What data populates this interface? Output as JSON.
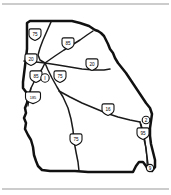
{
  "figure": {
    "name": "georgia-interstate-highway-map",
    "background_color": "#ffffff",
    "outline_color": "#111111",
    "route_color": "#1a1a1a",
    "frame_color": "#9a9a9a"
  },
  "state": {
    "name": "Georgia",
    "outline_path": "M 27,42 L 27,49 L 26,58 L 25,66 L 24,74 L 23,82 L 23,88 L 26,92 L 28,97 L 27,103 L 25,108 L 26,113 L 24,118 L 26,123 L 25,129 L 28,135 L 31,140 L 33,147 L 34,155 L 36,161 L 38,166 L 42,170 L 50,171 L 62,171 L 75,171 L 88,172 L 100,172 L 112,172 L 124,172 L 133,172 L 136,166 L 139,162 L 143,162 L 146,166 L 148,170 L 152,171 L 155,167 L 155,160 L 153,152 L 151,144 L 150,136 L 150,128 L 151,121 L 152,114 L 150,108 L 146,103 L 142,97 L 138,91 L 134,85 L 130,79 L 126,73 L 122,68 L 118,63 L 115,58 L 113,53 L 110,49 L 108,44 L 106,40 L 104,36 L 101,33 L 98,31 L 95,30 L 92,28 L 89,26 L 86,25 L 83,24 L 80,23 L 76,22 L 72,21 L 68,21 L 63,21 L 57,21 L 50,21 L 43,21 L 36,21 L 30,21 L 27,23 Z"
  },
  "routes": [
    {
      "id": "i75-north",
      "label": "75",
      "path": "M 51,22 L 47,31 L 43,40 L 40,48 L 38,55 L 40,60 L 45,63"
    },
    {
      "id": "i85-northeast",
      "label": "85",
      "path": "M 45,63 L 55,56 L 64,50 L 72,45 L 80,40 L 87,35 L 93,31"
    },
    {
      "id": "i20-west",
      "label": "20",
      "path": "M 24,61 L 30,62 L 36,62 L 45,63"
    },
    {
      "id": "i20-east",
      "label": "20",
      "path": "M 45,63 L 58,65 L 70,67 L 82,69 L 94,70 L 104,70 L 110,69"
    },
    {
      "id": "i85-southwest",
      "label": "85",
      "path": "M 45,63 L 42,69 L 38,75 L 34,82 L 31,88 L 29,94 L 28,100"
    },
    {
      "id": "i185-spur",
      "label": "185",
      "path": "M 31,88 L 30,94 L 29,100 L 28,106"
    },
    {
      "id": "i75-south",
      "label": "75",
      "path": "M 45,63 L 48,70 L 52,78 L 57,87 L 63,97 L 68,108 L 71,119 L 73,130 L 74,141 L 76,152 L 78,162 L 79,171"
    },
    {
      "id": "i16-southeast",
      "label": "16",
      "path": "M 59,91 L 70,97 L 82,103 L 94,108 L 106,113 L 118,117 L 130,120 L 140,122"
    },
    {
      "id": "i95-coastal",
      "label": "95",
      "path": "M 140,122 L 142,130 L 144,139 L 146,148 L 147,157 L 148,164 L 148,170"
    },
    {
      "id": "i95-coastal-inner",
      "label": "95",
      "path": "M 141,124 L 143,132 L 145,141 L 146,150 L 147,158 L 147,166"
    }
  ],
  "shields": [
    {
      "id": "shield-i75-north",
      "number": "75",
      "digits": 2,
      "x": 35,
      "y": 36,
      "type": "interstate"
    },
    {
      "id": "shield-i85-north",
      "number": "85",
      "digits": 2,
      "x": 68,
      "y": 45,
      "type": "interstate"
    },
    {
      "id": "shield-i20-west",
      "number": "20",
      "digits": 2,
      "x": 31,
      "y": 61,
      "type": "interstate"
    },
    {
      "id": "shield-i20-east",
      "number": "20",
      "digits": 2,
      "x": 92,
      "y": 66,
      "type": "interstate"
    },
    {
      "id": "shield-i85-south",
      "number": "85",
      "digits": 2,
      "x": 36,
      "y": 78,
      "type": "interstate"
    },
    {
      "id": "shield-i75-hub",
      "number": "75",
      "digits": 2,
      "x": 60,
      "y": 78,
      "type": "interstate"
    },
    {
      "id": "shield-i185",
      "number": "185",
      "digits": 3,
      "x": 33,
      "y": 99,
      "type": "interstate"
    },
    {
      "id": "shield-i16",
      "number": "16",
      "digits": 2,
      "x": 108,
      "y": 111,
      "type": "interstate"
    },
    {
      "id": "shield-i95",
      "number": "95",
      "digits": 2,
      "x": 143,
      "y": 135,
      "type": "interstate"
    },
    {
      "id": "shield-i75-lower",
      "number": "75",
      "digits": 2,
      "x": 76,
      "y": 141,
      "type": "interstate"
    }
  ],
  "markers": [
    {
      "id": "marker-atlanta-hub",
      "label": "I",
      "x": 45,
      "y": 78,
      "radius": 4.2
    },
    {
      "id": "marker-savannah",
      "label": "2",
      "x": 146,
      "y": 120,
      "radius": 3.8
    },
    {
      "id": "marker-brunswick",
      "label": "9",
      "x": 150,
      "y": 168,
      "radius": 3.6
    }
  ],
  "frame": {
    "top_line_y": 4,
    "bottom_line_y": 189,
    "left_x": 2,
    "right_x": 169
  }
}
